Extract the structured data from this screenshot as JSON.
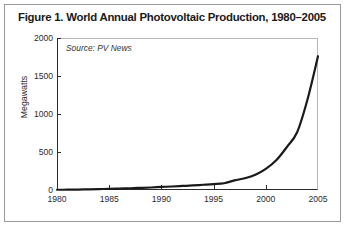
{
  "figure": {
    "title": "Figure 1. World Annual Photovoltaic Production, 1980–2005",
    "source_note": "Source: PV News",
    "border_color": "#9a9a9a"
  },
  "chart_data": {
    "type": "line",
    "title": "Figure 1. World Annual Photovoltaic Production, 1980–2005",
    "subtitle": "",
    "annotation": "Source: PV News",
    "xlabel": "",
    "ylabel": "Megawatts",
    "xlim": [
      1980,
      2005
    ],
    "ylim": [
      0,
      2000
    ],
    "xticks": [
      1980,
      1985,
      1990,
      1995,
      2000,
      2005
    ],
    "yticks": [
      0,
      500,
      1000,
      1500,
      2000
    ],
    "xtick_labels": [
      "1980",
      "1985",
      "1990",
      "1995",
      "2000",
      "2005"
    ],
    "ytick_labels": [
      "0",
      "500",
      "1000",
      "1500",
      "2000"
    ],
    "grid": false,
    "legend": false,
    "line_color": "#1a1a1a",
    "line_width": 2.2,
    "x": [
      1980,
      1981,
      1982,
      1983,
      1984,
      1985,
      1986,
      1987,
      1988,
      1989,
      1990,
      1991,
      1992,
      1993,
      1994,
      1995,
      1996,
      1997,
      1998,
      1999,
      2000,
      2001,
      2002,
      2003,
      2004,
      2005
    ],
    "values": [
      3,
      4,
      6,
      9,
      12,
      15,
      19,
      23,
      28,
      33,
      40,
      46,
      53,
      60,
      69,
      78,
      89,
      126,
      155,
      201,
      278,
      391,
      562,
      760,
      1195,
      1760
    ],
    "series": [
      {
        "name": "World annual photovoltaic production",
        "units": "Megawatts",
        "values": [
          3,
          4,
          6,
          9,
          12,
          15,
          19,
          23,
          28,
          33,
          40,
          46,
          53,
          60,
          69,
          78,
          89,
          126,
          155,
          201,
          278,
          391,
          562,
          760,
          1195,
          1760
        ]
      }
    ]
  }
}
